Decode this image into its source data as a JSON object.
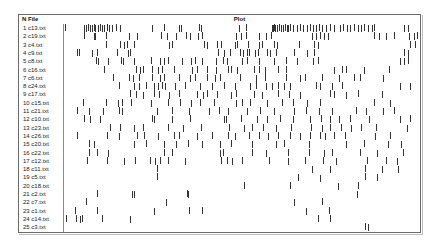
{
  "table": {
    "header_n": "N",
    "header_file": "File",
    "header_plot": "Plot"
  },
  "rows": [
    {
      "n": 1,
      "file": "c13.txt",
      "ticks": [
        1,
        20,
        22,
        24,
        26,
        28,
        30,
        31,
        34,
        36,
        38,
        40,
        43,
        45,
        48,
        52,
        56,
        88,
        100,
        115,
        117,
        135,
        137,
        175,
        182,
        208,
        209,
        210,
        211,
        213,
        215,
        217,
        219,
        221,
        223,
        224,
        226,
        229,
        233,
        236,
        239,
        243,
        246,
        249,
        252,
        255,
        258,
        262,
        266,
        270,
        276,
        279,
        283,
        286,
        290,
        294,
        297,
        300,
        304,
        308,
        310,
        340,
        344
      ]
    },
    {
      "n": 2,
      "file": "c19.txt",
      "ticks": [
        20,
        30,
        31,
        42,
        65,
        73,
        97,
        103,
        112,
        122,
        126,
        134,
        138,
        172,
        177,
        182,
        195,
        202,
        207,
        248,
        252,
        256,
        260,
        264,
        310,
        315,
        322,
        330,
        345,
        350,
        353
      ]
    },
    {
      "n": 3,
      "file": "c4.txt",
      "ticks": [
        42,
        56,
        60,
        63,
        70,
        105,
        108,
        140,
        143,
        153,
        157,
        171,
        173,
        184,
        195,
        198,
        210,
        213,
        235,
        250,
        254,
        346,
        351
      ]
    },
    {
      "n": 4,
      "file": "c9.txt",
      "ticks": [
        13,
        15,
        28,
        33,
        53,
        64,
        66,
        154,
        160,
        166,
        176,
        179,
        183,
        185,
        191,
        194,
        203,
        206,
        212,
        230,
        243,
        250,
        340,
        344
      ]
    },
    {
      "n": 5,
      "file": "c8.txt",
      "ticks": [
        32,
        34,
        44,
        57,
        59,
        70,
        87,
        96,
        100,
        104,
        118,
        127,
        131,
        138,
        152,
        159,
        163,
        178,
        183,
        195,
        210,
        222,
        233,
        249,
        254,
        336,
        340,
        344
      ]
    },
    {
      "n": 6,
      "file": "c16.txt",
      "ticks": [
        40,
        72,
        76,
        79,
        88,
        94,
        98,
        110,
        128,
        133,
        143,
        152,
        164,
        167,
        173,
        190,
        195,
        201,
        214,
        222,
        270,
        278,
        282,
        300,
        325
      ]
    },
    {
      "n": 7,
      "file": "c6.txt",
      "ticks": [
        49,
        65,
        69,
        75,
        88,
        96,
        100,
        115,
        126,
        131,
        143,
        151,
        156,
        176,
        192,
        201,
        222,
        236,
        241,
        258,
        275,
        290,
        296,
        319
      ]
    },
    {
      "n": 8,
      "file": "c24.txt",
      "ticks": [
        55,
        70,
        75,
        82,
        90,
        94,
        98,
        101,
        111,
        121,
        136,
        148,
        160,
        171,
        186,
        192,
        202,
        208,
        214,
        220,
        226,
        252,
        256,
        268,
        278,
        336,
        346
      ]
    },
    {
      "n": 9,
      "file": "c17.txt",
      "ticks": [
        66,
        72,
        79,
        90,
        95,
        105,
        115,
        133,
        139,
        143,
        153,
        167,
        172,
        190,
        198,
        214,
        225,
        236,
        266,
        270,
        282,
        294,
        318
      ]
    },
    {
      "n": 10,
      "file": "c15.txt",
      "ticks": [
        19,
        42,
        54,
        58,
        67,
        87,
        104,
        116,
        127,
        136,
        150,
        172,
        178,
        186,
        203,
        218,
        229,
        243,
        256,
        310,
        326
      ]
    },
    {
      "n": 11,
      "file": "c21.txt",
      "ticks": [
        13,
        25,
        39,
        55,
        58,
        93,
        108,
        125,
        145,
        155,
        164,
        183,
        196,
        210,
        230,
        242,
        255,
        268,
        292,
        302,
        319,
        330
      ]
    },
    {
      "n": 12,
      "file": "c10.txt",
      "ticks": [
        20,
        26,
        36,
        88,
        90,
        108,
        126,
        160,
        162,
        177,
        193,
        203,
        216,
        229,
        246,
        257,
        266,
        275,
        286,
        305,
        336,
        346
      ]
    },
    {
      "n": 13,
      "file": "c23.txt",
      "ticks": [
        46,
        56,
        70,
        79,
        104,
        119,
        137,
        165,
        180,
        188,
        199,
        212,
        227,
        247,
        258,
        266,
        277,
        287,
        297,
        312,
        343
      ]
    },
    {
      "n": 14,
      "file": "c26.txt",
      "ticks": [
        13,
        43,
        55,
        73,
        80,
        94,
        110,
        115,
        133,
        148,
        164,
        171,
        185,
        195,
        204,
        214,
        226,
        236,
        246,
        256,
        261,
        270,
        281,
        311,
        326
      ]
    },
    {
      "n": 15,
      "file": "c20.txt",
      "ticks": [
        25,
        30,
        70,
        82,
        100,
        112,
        124,
        138,
        156,
        167,
        188,
        212,
        220,
        245,
        282,
        300,
        324,
        337
      ]
    },
    {
      "n": 16,
      "file": "c22.txt",
      "ticks": [
        25,
        33,
        44,
        100,
        108,
        156,
        159,
        188,
        202,
        224,
        245,
        260,
        268,
        296,
        313,
        339
      ]
    },
    {
      "n": 17,
      "file": "c12.txt",
      "ticks": [
        23,
        43,
        60,
        71,
        86,
        91,
        96,
        104,
        121,
        157,
        163,
        168,
        178,
        205,
        224,
        241,
        259,
        272,
        303,
        322,
        333
      ]
    },
    {
      "n": 18,
      "file": "c11.txt",
      "ticks": [
        93,
        248,
        266,
        301,
        318,
        334
      ]
    },
    {
      "n": 19,
      "file": "c5.txt",
      "ticks": [
        93,
        234,
        256,
        301,
        313
      ]
    },
    {
      "n": 20,
      "file": "c18.txt",
      "ticks": [
        180,
        226,
        274,
        294
      ]
    },
    {
      "n": 21,
      "file": "c2.txt",
      "ticks": [
        33,
        68,
        70,
        123,
        124,
        293
      ]
    },
    {
      "n": 22,
      "file": "c7.txt",
      "ticks": [
        22,
        102,
        230,
        258
      ]
    },
    {
      "n": 23,
      "file": "c1.txt",
      "ticks": [
        11,
        33,
        90,
        125,
        138,
        242,
        265
      ]
    },
    {
      "n": 24,
      "file": "c14.txt",
      "ticks": [
        2,
        12,
        16,
        18,
        38,
        66,
        254,
        266
      ]
    },
    {
      "n": 25,
      "file": "c3.txt",
      "ticks": [
        301,
        304
      ]
    }
  ],
  "chart_data": {
    "type": "table",
    "title": "Plot",
    "columns": [
      "N",
      "File",
      "Plot"
    ],
    "categories": [
      "c13.txt",
      "c19.txt",
      "c4.txt",
      "c9.txt",
      "c8.txt",
      "c16.txt",
      "c6.txt",
      "c24.txt",
      "c17.txt",
      "c15.txt",
      "c21.txt",
      "c10.txt",
      "c23.txt",
      "c26.txt",
      "c20.txt",
      "c22.txt",
      "c12.txt",
      "c11.txt",
      "c5.txt",
      "c18.txt",
      "c2.txt",
      "c7.txt",
      "c1.txt",
      "c14.txt",
      "c3.txt"
    ],
    "approx_hit_counts": [
      63,
      31,
      23,
      24,
      28,
      25,
      24,
      27,
      23,
      21,
      22,
      22,
      21,
      25,
      18,
      16,
      21,
      6,
      5,
      4,
      6,
      4,
      7,
      8,
      2
    ],
    "grid": false,
    "legend": null
  }
}
